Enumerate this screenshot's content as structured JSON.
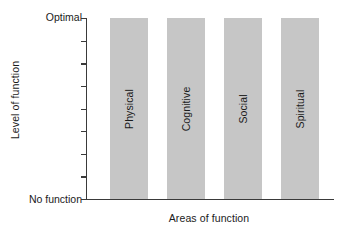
{
  "chart_data": {
    "type": "bar",
    "title": "",
    "subtitle": "",
    "xlabel": "Areas of function",
    "ylabel": "Level of function",
    "categories": [
      "Physical",
      "Cognitive",
      "Social",
      "Spiritual"
    ],
    "values": [
      100,
      100,
      100,
      100
    ],
    "ylim": [
      0,
      100
    ],
    "y_tick_labels": {
      "top": "Optimal",
      "bottom": "No function"
    },
    "y_tick_count": 9,
    "grid": false,
    "legend": null,
    "bar_color": "#c6c6c6",
    "axis_color": "#3a3a3a",
    "text_color": "#1a1a1a",
    "background": "#ffffff",
    "annotations": [
      {
        "text": "Physical",
        "orientation": "vertical",
        "position": "inside-bar-1"
      },
      {
        "text": "Cognitive",
        "orientation": "vertical",
        "position": "inside-bar-2"
      },
      {
        "text": "Social",
        "orientation": "vertical",
        "position": "inside-bar-3"
      },
      {
        "text": "Spiritual",
        "orientation": "vertical",
        "position": "inside-bar-4"
      }
    ]
  }
}
